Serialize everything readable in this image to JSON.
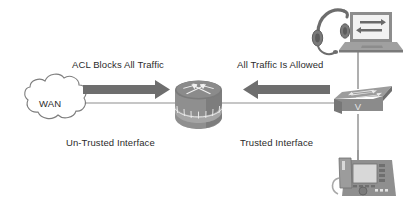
{
  "diagram": {
    "background_color": "#ffffff",
    "line_color": "#8a8a8a",
    "arrow_color": "#6e6e6e",
    "text_color": "#2b2b2b",
    "device_fill": "#9a9a9a",
    "device_dark": "#6b6b6b",
    "device_light": "#c2c2c2"
  },
  "labels": {
    "acl_blocks": "ACL Blocks All Traffic",
    "all_traffic_allowed": "All Traffic Is Allowed",
    "untrusted_interface": "Un-Trusted Interface",
    "trusted_interface": "Trusted Interface",
    "switch_marking": "V"
  },
  "nodes": {
    "wan_cloud": {
      "name": "WAN",
      "label": "WAN",
      "type": "cloud"
    },
    "router": {
      "name": "Router",
      "type": "router"
    },
    "switch": {
      "name": "Switch",
      "type": "switch",
      "front_marking": "V"
    },
    "laptop": {
      "name": "Laptop",
      "type": "laptop"
    },
    "headset": {
      "name": "Headset",
      "type": "headset"
    },
    "ip_phone": {
      "name": "IP Phone",
      "type": "ip-phone"
    }
  },
  "flows": [
    {
      "name": "untrusted-inbound",
      "direction": "right",
      "label": "ACL Blocks All Traffic"
    },
    {
      "name": "trusted-outbound",
      "direction": "left",
      "label": "All Traffic Is Allowed"
    }
  ]
}
